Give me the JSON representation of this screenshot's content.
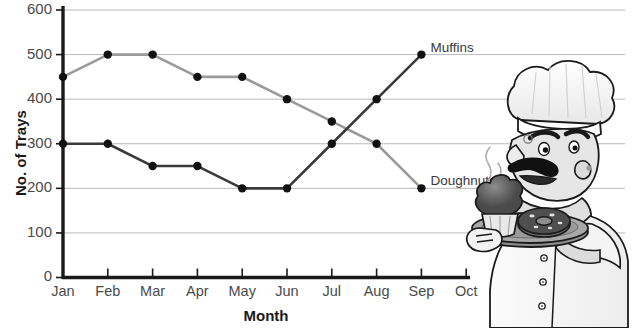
{
  "chart_data": {
    "type": "line",
    "title": "",
    "xlabel": "Month",
    "ylabel": "No. of Trays",
    "categories": [
      "Jan",
      "Feb",
      "Mar",
      "Apr",
      "May",
      "Jun",
      "Jul",
      "Aug",
      "Sep",
      "Oct"
    ],
    "xtick_labels": [
      "Jan",
      "Feb",
      "Mar",
      "Apr",
      "May",
      "Jun",
      "Jul",
      "Aug",
      "Sep",
      "Oct"
    ],
    "ytick_labels": [
      "0",
      "100",
      "200",
      "300",
      "400",
      "500",
      "600"
    ],
    "yticks": [
      0,
      100,
      200,
      300,
      400,
      500,
      600
    ],
    "ylim": [
      0,
      600
    ],
    "grid": "horizontal",
    "legend": "inline-end-of-line",
    "series": [
      {
        "name": "Doughnuts",
        "color": "#9a9a9a",
        "marker_color": "#111111",
        "x": [
          "Jan",
          "Feb",
          "Mar",
          "Apr",
          "May",
          "Jun",
          "Jul",
          "Aug",
          "Sep"
        ],
        "values": [
          450,
          500,
          500,
          450,
          450,
          400,
          350,
          300,
          200
        ]
      },
      {
        "name": "Muffins",
        "color": "#3a3a3a",
        "marker_color": "#111111",
        "x": [
          "Jan",
          "Feb",
          "Mar",
          "Apr",
          "May",
          "Jun",
          "Jul",
          "Aug",
          "Sep"
        ],
        "values": [
          300,
          300,
          250,
          250,
          200,
          200,
          300,
          400,
          500
        ]
      }
    ],
    "annotations": [
      {
        "text": "Muffins",
        "series": "Muffins",
        "at_x": "Sep",
        "at_y": 500
      },
      {
        "text": "Doughnuts",
        "series": "Doughnuts",
        "at_x": "Sep",
        "at_y": 200
      }
    ],
    "axis_color": "#1a1a1a",
    "grid_color": "#b9b9b9"
  },
  "illustration": {
    "name": "chef-with-tray",
    "description": "Cartoon chef with mustache and chef hat holding a tray with a muffin and a doughnut",
    "alt": "chef-illustration"
  }
}
